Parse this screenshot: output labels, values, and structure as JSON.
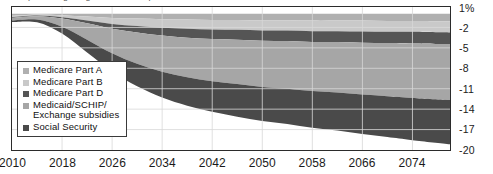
{
  "title_sliver": "percentage of gross domestic product",
  "chart_data": {
    "type": "area",
    "stacked": true,
    "title": "",
    "xlabel": "",
    "ylabel": "",
    "xlim": [
      2010,
      2080
    ],
    "ylim": [
      -20,
      1
    ],
    "grid": true,
    "legend_position": "inside-left",
    "x_ticks": [
      "2010",
      "2018",
      "2026",
      "2034",
      "2042",
      "2050",
      "2058",
      "2066",
      "2074"
    ],
    "x_tick_values": [
      2010,
      2018,
      2026,
      2034,
      2042,
      2050,
      2058,
      2066,
      2074
    ],
    "y_ticks": [
      "1%",
      "-2",
      "-5",
      "-8",
      "-11",
      "-14",
      "-17",
      "-20"
    ],
    "y_tick_values": [
      1,
      -2,
      -5,
      -8,
      -11,
      -14,
      -17,
      -20
    ],
    "x": [
      2010,
      2014,
      2018,
      2022,
      2026,
      2030,
      2034,
      2038,
      2042,
      2046,
      2050,
      2054,
      2058,
      2062,
      2066,
      2070,
      2074,
      2080
    ],
    "series": [
      {
        "name": "Medicare Part A",
        "color": "#b0b0b0",
        "values": [
          -0.3,
          -0.1,
          -0.2,
          -0.4,
          -0.6,
          -0.7,
          -0.8,
          -0.85,
          -0.9,
          -0.9,
          -0.95,
          -0.95,
          -1.0,
          -1.0,
          -1.0,
          -1.05,
          -1.05,
          -1.1
        ]
      },
      {
        "name": "Medicare Part B",
        "color": "#c9c9c9",
        "values": [
          -0.2,
          -0.15,
          -0.3,
          -0.6,
          -0.9,
          -1.1,
          -1.25,
          -1.35,
          -1.4,
          -1.45,
          -1.5,
          -1.5,
          -1.55,
          -1.55,
          -1.6,
          -1.6,
          -1.6,
          -1.65
        ]
      },
      {
        "name": "Medicare Part D",
        "color": "#555555",
        "values": [
          -0.1,
          -0.1,
          -0.2,
          -0.4,
          -0.7,
          -0.95,
          -1.15,
          -1.3,
          -1.4,
          -1.45,
          -1.5,
          -1.55,
          -1.6,
          -1.6,
          -1.65,
          -1.65,
          -1.7,
          -1.7
        ]
      },
      {
        "name": "Medicaid/SCHIP/\nExchange subsidies",
        "color": "#a6a6a6",
        "values": [
          -0.4,
          -0.5,
          -1.2,
          -2.4,
          -3.6,
          -4.6,
          -5.3,
          -5.8,
          -6.2,
          -6.5,
          -6.8,
          -7.0,
          -7.2,
          -7.4,
          -7.6,
          -7.8,
          -8.0,
          -8.2
        ]
      },
      {
        "name": "Social Security",
        "color": "#4a4a4a",
        "values": [
          -0.2,
          -0.4,
          -1.0,
          -1.9,
          -2.7,
          -3.3,
          -3.8,
          -4.2,
          -4.5,
          -4.8,
          -5.0,
          -5.2,
          -5.4,
          -5.6,
          -5.8,
          -6.0,
          -6.2,
          -6.5
        ]
      }
    ]
  }
}
